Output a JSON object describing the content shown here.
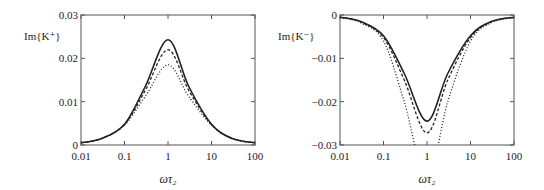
{
  "chart_data": [
    {
      "type": "line",
      "panel": "left",
      "title": "",
      "ylabel": "Im{K⁺}",
      "xlabel": "ωτ₂",
      "xscale": "log",
      "xlim": [
        0.01,
        100
      ],
      "ylim": [
        0,
        0.03
      ],
      "xticks": [
        0.01,
        0.1,
        1,
        10,
        100
      ],
      "xtick_labels": [
        "0.01",
        "0.1",
        "1",
        "10",
        "100"
      ],
      "yticks": [
        0,
        0.01,
        0.02,
        0.03
      ],
      "ytick_labels": [
        "0",
        "0.01",
        "0.02",
        "0.03"
      ],
      "grid": false,
      "legend": "none",
      "series": [
        {
          "name": "solid",
          "style": "solid",
          "x": [
            0.01,
            0.03,
            0.1,
            0.3,
            1,
            3,
            10,
            30,
            100
          ],
          "y": [
            0.0005,
            0.0015,
            0.0048,
            0.0135,
            0.0243,
            0.0135,
            0.0048,
            0.0015,
            0.0005
          ]
        },
        {
          "name": "dashed",
          "style": "dashed",
          "x": [
            0.01,
            0.03,
            0.1,
            0.3,
            1,
            3,
            10,
            30,
            100
          ],
          "y": [
            0.0005,
            0.0015,
            0.0047,
            0.0126,
            0.022,
            0.0126,
            0.0047,
            0.0015,
            0.0005
          ]
        },
        {
          "name": "dotted",
          "style": "dotted",
          "x": [
            0.01,
            0.03,
            0.1,
            0.3,
            1,
            3,
            10,
            30,
            100
          ],
          "y": [
            0.0005,
            0.0015,
            0.0046,
            0.0112,
            0.0185,
            0.0112,
            0.0046,
            0.0015,
            0.0005
          ]
        }
      ]
    },
    {
      "type": "line",
      "panel": "right",
      "title": "",
      "ylabel": "Im{K⁻}",
      "xlabel": "ωτ₂",
      "xscale": "log",
      "xlim": [
        0.01,
        100
      ],
      "ylim": [
        -0.03,
        0
      ],
      "xticks": [
        0.01,
        0.1,
        1,
        10,
        100
      ],
      "xtick_labels": [
        "0.01",
        "0.1",
        "1",
        "10",
        "100"
      ],
      "yticks": [
        0,
        -0.01,
        -0.02,
        -0.03
      ],
      "ytick_labels": [
        "0",
        "−0.01",
        "−0.02",
        "−0.03"
      ],
      "grid": false,
      "legend": "none",
      "series": [
        {
          "name": "solid",
          "style": "solid",
          "x": [
            0.01,
            0.03,
            0.1,
            0.3,
            1,
            3,
            10,
            30,
            100
          ],
          "y": [
            -0.0005,
            -0.0015,
            -0.0048,
            -0.0135,
            -0.0245,
            -0.0135,
            -0.0048,
            -0.0015,
            -0.0005
          ]
        },
        {
          "name": "dashed",
          "style": "dashed",
          "x": [
            0.01,
            0.03,
            0.1,
            0.3,
            1,
            3,
            10,
            30,
            100
          ],
          "y": [
            -0.0005,
            -0.0016,
            -0.0052,
            -0.015,
            -0.0272,
            -0.015,
            -0.0052,
            -0.0016,
            -0.0005
          ]
        },
        {
          "name": "dotted",
          "style": "dotted",
          "x": [
            0.01,
            0.03,
            0.1,
            0.3,
            1,
            3,
            10,
            30,
            100
          ],
          "y": [
            -0.0006,
            -0.0018,
            -0.006,
            -0.02,
            -0.038,
            -0.02,
            -0.006,
            -0.0018,
            -0.0006
          ]
        }
      ]
    }
  ]
}
